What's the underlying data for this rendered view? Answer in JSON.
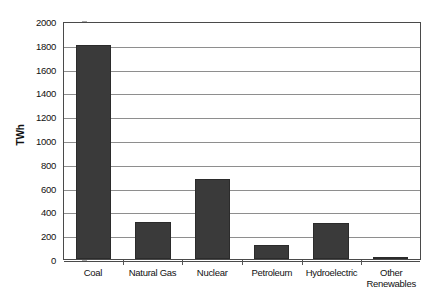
{
  "chart_data": {
    "type": "bar",
    "title": "",
    "subtitle": "",
    "xlabel": "",
    "ylabel": "TWh",
    "ylim": [
      0,
      2000
    ],
    "ytick_step": 200,
    "grid": true,
    "legend": false,
    "bar_color": "#3a3a3a",
    "gridline_color": "#8e8e8e",
    "frame_color": "#4a4a4a",
    "categories": [
      "Coal",
      "Natural Gas",
      "Nuclear",
      "Petroleum",
      "Hydroelectric",
      "Other Renewables"
    ],
    "category_lines": [
      [
        "Coal"
      ],
      [
        "Natural Gas"
      ],
      [
        "Nuclear"
      ],
      [
        "Petroleum"
      ],
      [
        "Hydroelectric"
      ],
      [
        "Other",
        "Renewables"
      ]
    ],
    "values": [
      1800,
      310,
      675,
      115,
      305,
      20
    ],
    "yticks": [
      0,
      200,
      400,
      600,
      800,
      1000,
      1200,
      1400,
      1600,
      1800,
      2000
    ],
    "ytick_labels": [
      "0",
      "200",
      "400",
      "600",
      "800",
      "1000",
      "1200",
      "1400",
      "1600",
      "1800",
      "2000"
    ]
  }
}
